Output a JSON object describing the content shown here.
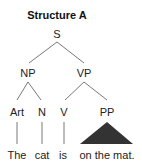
{
  "diagram": {
    "title": "Structure A",
    "type": "syntax-tree",
    "nodes": {
      "root": "S",
      "np": "NP",
      "vp": "VP",
      "art": "Art",
      "n": "N",
      "v": "V",
      "pp": "PP"
    },
    "leaves": {
      "art": "The",
      "n": "cat",
      "v": "is",
      "pp": "on the mat."
    },
    "colors": {
      "line": "#555555",
      "triangle": "#333333",
      "text": "#222222"
    }
  }
}
